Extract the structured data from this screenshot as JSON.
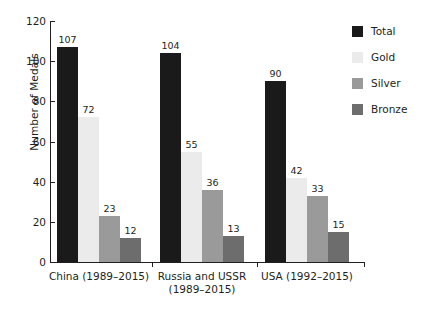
{
  "chart_data": {
    "type": "bar",
    "title": "",
    "xlabel": "",
    "ylabel": "Number of Medals",
    "ylim": [
      0,
      120
    ],
    "yticks": [
      0,
      20,
      40,
      60,
      80,
      100,
      120
    ],
    "grid": false,
    "legend_position": "right",
    "categories": [
      "China (1989–2015)",
      "Russia and USSR\n(1989–2015)",
      "USA (1992–2015)"
    ],
    "series": [
      {
        "name": "Total",
        "color": "#1a1a1a",
        "values": [
          107,
          104,
          90
        ]
      },
      {
        "name": "Gold",
        "color": "#ebebeb",
        "values": [
          72,
          55,
          42
        ]
      },
      {
        "name": "Silver",
        "color": "#9a9a9a",
        "values": [
          23,
          36,
          33
        ]
      },
      {
        "name": "Bronze",
        "color": "#6d6d6d",
        "values": [
          12,
          13,
          15
        ]
      }
    ]
  },
  "legend": {
    "items": [
      {
        "label": "Total"
      },
      {
        "label": "Gold"
      },
      {
        "label": "Silver"
      },
      {
        "label": "Bronze"
      }
    ]
  },
  "axes": {
    "y_title": "Number of Medals",
    "y_tick_labels": [
      "0",
      "20",
      "40",
      "60",
      "80",
      "100",
      "120"
    ]
  }
}
